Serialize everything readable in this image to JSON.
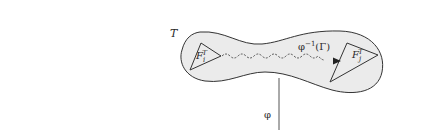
{
  "diagram": {
    "type": "mapping-diagram",
    "region_label": "T",
    "left_face": {
      "base": "F",
      "sub": "i",
      "sup": "T"
    },
    "right_face": {
      "base": "F",
      "sub": "j",
      "sup": "T"
    },
    "path_label": "φ⁻¹(Γ)",
    "path_label_parts": {
      "fn": "φ",
      "exp": "−1",
      "arg": "(Γ)"
    },
    "map_label": "φ",
    "colors": {
      "region_fill": "#ebebeb",
      "stroke": "#333333",
      "path": "#444444",
      "map_line": "#555555"
    }
  }
}
